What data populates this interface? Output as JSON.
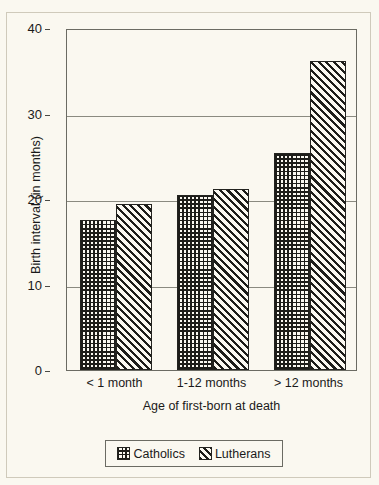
{
  "figure": {
    "top_caption_clipped": "",
    "background_color": "#faf8f0",
    "ink_color": "#1d1d19"
  },
  "legend": {
    "position": "below-plot",
    "items": [
      {
        "label": "Catholics",
        "pattern": "crosshatch-grid",
        "swatch_name": "legend-swatch-catholics"
      },
      {
        "label": "Lutherans",
        "pattern": "diagonal-hatch",
        "swatch_name": "legend-swatch-lutherans"
      }
    ]
  },
  "chart_data": {
    "type": "bar",
    "title": "",
    "xlabel": "Age of first-born at death",
    "ylabel": "Birth interval (in months)",
    "categories": [
      "< 1 month",
      "1-12 months",
      "> 12 months"
    ],
    "series": [
      {
        "name": "Catholics",
        "values": [
          17.5,
          20.5,
          25.4
        ]
      },
      {
        "name": "Lutherans",
        "values": [
          19.4,
          21.2,
          36.2
        ]
      }
    ],
    "ylim": [
      0,
      40
    ],
    "yticks": [
      0,
      10,
      20,
      30,
      40
    ],
    "ytick_labels": [
      "0",
      "10",
      "20",
      "30",
      "40"
    ],
    "grid": "horizontal",
    "legend_position": "bottom"
  }
}
